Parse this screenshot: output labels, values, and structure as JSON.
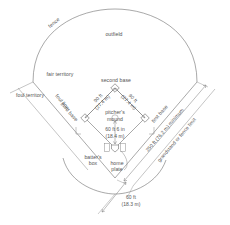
{
  "diagram": {
    "labels": {
      "fence": "fence",
      "outfield": "outfield",
      "fair_territory": "fair territory",
      "foul_territory": "foul territory",
      "foul_line": "foul line",
      "second_base": "second base",
      "third_base": "third base",
      "first_base": "first base",
      "pitchers_mound_line1": "pitcher's",
      "pitchers_mound_line2": "mound",
      "batters_box_line1": "batter's",
      "batters_box_line2": "box",
      "home_plate_line1": "home",
      "home_plate_line2": "plate",
      "grandstand": "grandstand or fence limit"
    },
    "dimensions": {
      "baseline_third_ft": "90 ft",
      "baseline_third_m": "(27.4 m)",
      "baseline_first_ft": "90 ft",
      "baseline_first_m": "(27.4 m)",
      "mound_distance_ft": "60 ft 6 in",
      "mound_distance_m": "(18.4 m)",
      "backstop_ft": "60 ft",
      "backstop_m": "(18.3 m)",
      "outfield_min_ft": "250 ft (76.2 m) minimum"
    },
    "colors": {
      "line": "#6e6e6e",
      "text": "#555555",
      "background": "#ffffff"
    }
  }
}
